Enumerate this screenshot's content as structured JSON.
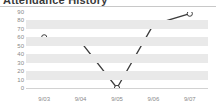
{
  "widget": {
    "title": "Attendance History",
    "background_color": "#ffffff",
    "band_color": "#e9e9e9",
    "axis_label_color": "#8a8a8a",
    "line_color": "#3c3c3c",
    "marker_fill": "#ffffff"
  },
  "chart_data": {
    "type": "line",
    "title": "Attendance History",
    "xlabel": "",
    "ylabel": "",
    "categories": [
      "9/03",
      "9/04",
      "9/05",
      "9/06",
      "9/07"
    ],
    "values": [
      60,
      55,
      0,
      75,
      88
    ],
    "series": [
      {
        "name": "Attendance",
        "values": [
          60,
          55,
          0,
          75,
          88
        ]
      }
    ],
    "ylim": [
      0,
      90
    ],
    "ytick_step": 10,
    "yticks": [
      90,
      80,
      70,
      60,
      50,
      40,
      30,
      20,
      10,
      0
    ],
    "ytick_labels": [
      "90",
      "80",
      "70",
      "60",
      "50",
      "40",
      "30",
      "20",
      "10",
      "0"
    ],
    "xticks": [
      "9/03",
      "9/04",
      "9/05",
      "9/06",
      "9/07"
    ],
    "grid": "horizontal-bands",
    "legend": "none",
    "marker": "open-circle"
  }
}
